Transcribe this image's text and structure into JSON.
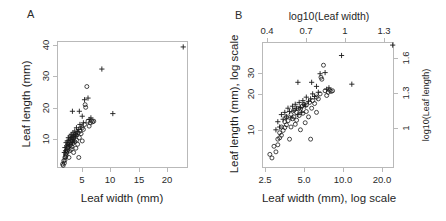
{
  "figure": {
    "background": "#ffffff",
    "marker_color": "#1a1a1a",
    "axis_color": "#b9b9b9"
  },
  "panels": {
    "a": {
      "letter": "A",
      "xlabel": "Leaf width (mm)",
      "ylabel": "Leaf length (mm)",
      "xticks": [
        "5",
        "10",
        "15",
        "20"
      ],
      "yticks": [
        "10",
        "20",
        "30",
        "40"
      ]
    },
    "b": {
      "letter": "B",
      "xlabel": "Leaf width (mm), log scale",
      "ylabel": "Leaf length (mm), log scale",
      "top_label": "log10(Leaf width)",
      "right_label": "log10(Leaf length)",
      "xticks": [
        "2.5",
        "5.0",
        "10.0",
        "20.0"
      ],
      "yticks": [
        "10",
        "20",
        "30"
      ],
      "top_ticks": [
        "0.4",
        "0.7",
        "1",
        "1.3"
      ],
      "right_ticks": [
        "1",
        "1.3",
        "1.6"
      ]
    }
  },
  "chart_data": [
    {
      "type": "scatter",
      "panel": "A",
      "title": "",
      "xlabel": "Leaf width (mm)",
      "ylabel": "Leaf length (mm)",
      "xlim": [
        1.8,
        24.5
      ],
      "ylim": [
        5.5,
        44.0
      ],
      "xticks": [
        5,
        10,
        15,
        20
      ],
      "yticks": [
        10,
        20,
        30,
        40
      ],
      "xscale": "linear",
      "yscale": "linear",
      "grid": false,
      "legend": "none",
      "series": [
        {
          "name": "circle-marker-group",
          "marker": "circle-open",
          "points": [
            [
              2.6,
              7.0
            ],
            [
              2.7,
              6.6
            ],
            [
              2.8,
              8.0
            ],
            [
              2.9,
              7.3
            ],
            [
              3.0,
              9.0
            ],
            [
              3.0,
              8.2
            ],
            [
              3.1,
              10.0
            ],
            [
              3.1,
              9.2
            ],
            [
              3.2,
              11.0
            ],
            [
              3.2,
              9.6
            ],
            [
              3.3,
              10.4
            ],
            [
              3.4,
              12.0
            ],
            [
              3.4,
              10.9
            ],
            [
              3.5,
              13.0
            ],
            [
              3.5,
              11.4
            ],
            [
              3.6,
              12.2
            ],
            [
              3.7,
              9.0
            ],
            [
              3.8,
              13.5
            ],
            [
              3.8,
              11.0
            ],
            [
              3.9,
              12.6
            ],
            [
              4.0,
              14.5
            ],
            [
              4.0,
              13.0
            ],
            [
              4.1,
              11.5
            ],
            [
              4.2,
              14.0
            ],
            [
              4.2,
              12.3
            ],
            [
              4.3,
              15.0
            ],
            [
              4.4,
              13.3
            ],
            [
              4.5,
              14.8
            ],
            [
              4.5,
              10.5
            ],
            [
              4.6,
              15.4
            ],
            [
              4.7,
              13.8
            ],
            [
              4.8,
              16.0
            ],
            [
              4.9,
              11.8
            ],
            [
              5.0,
              14.2
            ],
            [
              5.0,
              15.8
            ],
            [
              5.2,
              13.0
            ],
            [
              5.3,
              16.5
            ],
            [
              5.4,
              9.0
            ],
            [
              5.5,
              15.0
            ],
            [
              5.6,
              17.0
            ],
            [
              5.8,
              16.2
            ],
            [
              6.0,
              18.0
            ],
            [
              6.0,
              14.0
            ],
            [
              6.2,
              17.5
            ],
            [
              6.4,
              19.0
            ],
            [
              6.5,
              25.0
            ],
            [
              6.6,
              24.2
            ],
            [
              6.8,
              30.5
            ],
            [
              7.0,
              20.0
            ],
            [
              7.2,
              18.5
            ],
            [
              7.4,
              19.5
            ],
            [
              7.6,
              20.2
            ],
            [
              7.8,
              19.8
            ],
            [
              8.0,
              20.0
            ]
          ]
        },
        {
          "name": "plus-marker-group",
          "marker": "plus",
          "points": [
            [
              2.9,
              10.5
            ],
            [
              3.0,
              12.0
            ],
            [
              3.1,
              11.0
            ],
            [
              3.2,
              13.5
            ],
            [
              3.3,
              12.5
            ],
            [
              3.4,
              14.0
            ],
            [
              3.5,
              13.0
            ],
            [
              3.6,
              15.0
            ],
            [
              3.7,
              14.2
            ],
            [
              3.8,
              12.8
            ],
            [
              3.9,
              15.5
            ],
            [
              4.0,
              14.5
            ],
            [
              4.1,
              16.0
            ],
            [
              4.2,
              15.0
            ],
            [
              4.3,
              13.5
            ],
            [
              4.4,
              16.5
            ],
            [
              4.5,
              15.2
            ],
            [
              4.6,
              14.0
            ],
            [
              4.7,
              17.0
            ],
            [
              4.8,
              16.0
            ],
            [
              4.9,
              15.5
            ],
            [
              5.0,
              18.0
            ],
            [
              5.2,
              16.8
            ],
            [
              5.4,
              17.5
            ],
            [
              5.5,
              23.0
            ],
            [
              5.6,
              19.0
            ],
            [
              5.8,
              18.2
            ],
            [
              6.0,
              21.5
            ],
            [
              6.2,
              19.5
            ],
            [
              6.4,
              26.5
            ],
            [
              4.3,
              23.0
            ],
            [
              7.0,
              27.0
            ],
            [
              7.2,
              20.5
            ],
            [
              7.5,
              21.0
            ],
            [
              9.4,
              35.8
            ],
            [
              11.3,
              22.3
            ],
            [
              23.5,
              42.5
            ]
          ]
        }
      ]
    },
    {
      "type": "scatter",
      "panel": "B",
      "title": "",
      "xlabel": "Leaf width (mm), log scale",
      "ylabel": "Leaf length (mm), log scale",
      "top_axis_label": "log10(Leaf width)",
      "right_axis_label": "log10(Leaf length)",
      "xlim": [
        2.3,
        24.5
      ],
      "ylim": [
        5.5,
        44.0
      ],
      "xticks": [
        2.5,
        5.0,
        10.0,
        20.0
      ],
      "yticks": [
        10,
        20,
        30
      ],
      "top_ticks": [
        0.4,
        0.7,
        1.0,
        1.3
      ],
      "right_ticks": [
        1.0,
        1.3,
        1.6
      ],
      "xscale": "log10",
      "yscale": "log10",
      "grid": false,
      "legend": "none",
      "note": "Same data as panel A plotted on log10 axes"
    }
  ]
}
